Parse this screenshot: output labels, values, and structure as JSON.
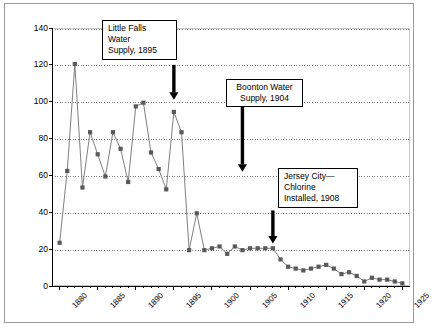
{
  "chart_data": {
    "type": "line",
    "title": "",
    "xlabel": "",
    "ylabel": "Typhoid Death Rate per 100,000 People",
    "xlim": [
      1879,
      1926
    ],
    "ylim": [
      0,
      140
    ],
    "ytick_step": 20,
    "yticks": [
      0,
      20,
      40,
      60,
      80,
      100,
      120,
      140
    ],
    "xticks": [
      1880,
      1885,
      1890,
      1895,
      1900,
      1905,
      1910,
      1915,
      1920,
      1925
    ],
    "grid": "horizontal-dotted",
    "legend": "none",
    "marker": "square",
    "series": [
      {
        "name": "Typhoid Death Rate",
        "x": [
          1880,
          1881,
          1882,
          1883,
          1884,
          1885,
          1886,
          1887,
          1888,
          1889,
          1890,
          1891,
          1892,
          1893,
          1894,
          1895,
          1896,
          1897,
          1898,
          1899,
          1900,
          1901,
          1902,
          1903,
          1904,
          1905,
          1906,
          1907,
          1908,
          1909,
          1910,
          1911,
          1912,
          1913,
          1914,
          1915,
          1916,
          1917,
          1918,
          1919,
          1920,
          1921,
          1922,
          1923,
          1924,
          1925
        ],
        "values": [
          24,
          63,
          121,
          54,
          84,
          72,
          60,
          84,
          75,
          57,
          98,
          100,
          73,
          64,
          53,
          95,
          84,
          20,
          40,
          20,
          21,
          22,
          18,
          22,
          20,
          21,
          21,
          21,
          21,
          15,
          11,
          10,
          9,
          10,
          11,
          12,
          10,
          7,
          8,
          6,
          3,
          5,
          4,
          4,
          3,
          2
        ]
      }
    ],
    "annotations": [
      {
        "name": "little-falls",
        "text": "Little Falls\nWater\nSupply, 1895",
        "align": "left",
        "arrow_year": 1895,
        "arrow_from": 120,
        "arrow_to": 101
      },
      {
        "name": "boonton",
        "text": "Boonton Water\nSupply, 1904",
        "align": "center",
        "arrow_year": 1904,
        "arrow_from": 98,
        "arrow_to": 62
      },
      {
        "name": "jersey-city-chlorine",
        "text": "Jersey City—\nChlorine\nInstalled, 1908",
        "align": "left",
        "arrow_year": 1908,
        "arrow_from": 41,
        "arrow_to": 23
      }
    ]
  },
  "axis": {
    "y_title": "Typhoid Death Rate per 100,000 People",
    "y_labels": [
      "140",
      "120",
      "100",
      "80",
      "60",
      "40",
      "20",
      "0"
    ],
    "x_labels": [
      "1880",
      "1885",
      "1890",
      "1895",
      "1900",
      "1905",
      "1910",
      "1915",
      "1920",
      "1925"
    ]
  },
  "callouts": {
    "little_falls": "Little Falls\nWater\nSupply, 1895",
    "boonton": "Boonton Water\nSupply, 1904",
    "jersey_city": "Jersey City—\nChlorine\nInstalled, 1908"
  },
  "colors": {
    "line": "#7f7f7f",
    "marker": "#595959",
    "grid": "#808080",
    "axis": "#000000",
    "frame": "#9a9a9a",
    "background": "#ffffff"
  }
}
